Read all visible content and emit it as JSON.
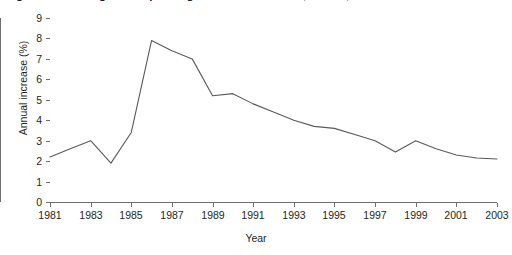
{
  "figure": {
    "title": "Figure 1.1  Nursing home spending in the United States, annual, 1981 to 2003",
    "background_color": "#ffffff",
    "line_color": "#58595b"
  },
  "chart_data": {
    "type": "line",
    "title": "Figure 1.1  Nursing home spending in the United States, annual, 1981 to 2003",
    "xlabel": "Year",
    "ylabel": "Annual increase (%)",
    "xlim": [
      1981,
      2003
    ],
    "ylim": [
      0,
      9
    ],
    "grid": false,
    "legend": "none",
    "x": [
      1981,
      1982,
      1983,
      1984,
      1985,
      1986,
      1987,
      1988,
      1989,
      1990,
      1991,
      1992,
      1993,
      1994,
      1995,
      1996,
      1997,
      1998,
      1999,
      2000,
      2001,
      2002,
      2003
    ],
    "values": [
      2.2,
      2.6,
      3.0,
      1.9,
      3.4,
      7.9,
      7.4,
      7.0,
      5.2,
      5.3,
      4.8,
      4.4,
      4.0,
      3.7,
      3.6,
      3.3,
      3.0,
      2.45,
      3.0,
      2.6,
      2.3,
      2.15,
      2.1
    ],
    "series": [
      {
        "name": "Annual increase (%)",
        "values": [
          2.2,
          2.6,
          3.0,
          1.9,
          3.4,
          7.9,
          7.4,
          7.0,
          5.2,
          5.3,
          4.8,
          4.4,
          4.0,
          3.7,
          3.6,
          3.3,
          3.0,
          2.45,
          3.0,
          2.6,
          2.3,
          2.15,
          2.1
        ]
      }
    ],
    "yticks": [
      0,
      1,
      2,
      3,
      4,
      5,
      6,
      7,
      8,
      9
    ],
    "ytick_labels": [
      "0",
      "1",
      "2",
      "3",
      "4",
      "5",
      "6",
      "7",
      "8",
      "9"
    ],
    "xticks": [
      1981,
      1983,
      1985,
      1987,
      1989,
      1991,
      1993,
      1995,
      1997,
      1999,
      2001,
      2003
    ],
    "xtick_labels": [
      "1981",
      "1983",
      "1985",
      "1987",
      "1989",
      "1991",
      "1993",
      "1995",
      "1997",
      "1999",
      "2001",
      "2003"
    ]
  }
}
